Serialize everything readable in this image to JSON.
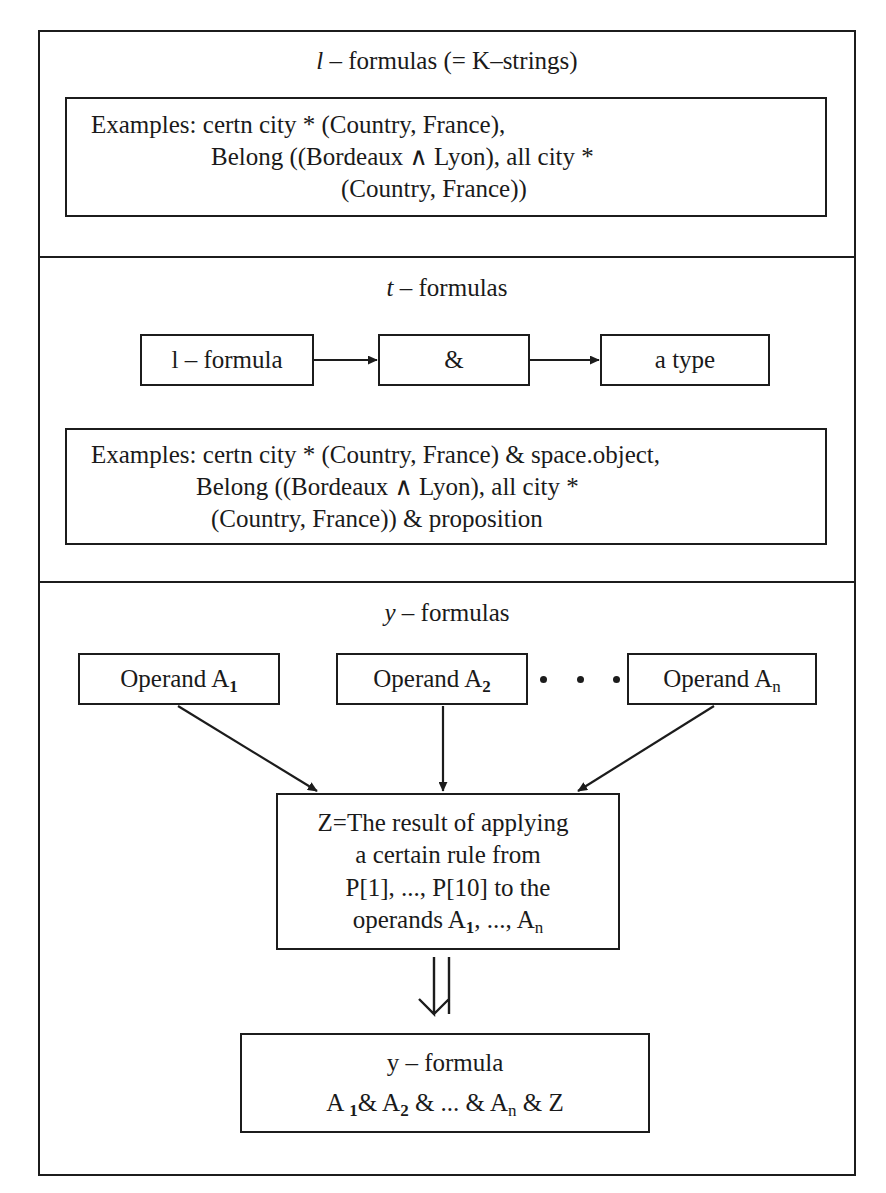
{
  "figure": {
    "sections": [
      {
        "id": "l-formulas",
        "title_prefix": "l",
        "title_rest": " – formulas (= K–strings)",
        "examples": {
          "line1": "Examples: certn city * (Country, France),",
          "line2": "Belong ((Bordeaux ∧ Lyon), all city *",
          "line3": "(Country, France))"
        }
      },
      {
        "id": "t-formulas",
        "title_prefix": "t",
        "title_rest": " – formulas",
        "chain": {
          "node1_prefix": "l",
          "node1_rest": " – formula",
          "node2": "&",
          "node3": "a type"
        },
        "examples": {
          "line1": "Examples: certn city * (Country, France) & space.object,",
          "line2": "Belong ((Bordeaux ∧ Lyon), all city *",
          "line3": "(Country, France)) & proposition"
        }
      },
      {
        "id": "y-formulas",
        "title_prefix": "y",
        "title_rest": " – formulas",
        "operands": [
          {
            "label": "Operand A",
            "subscript": "1",
            "subscript_bold": true
          },
          {
            "label": "Operand A",
            "subscript": "2",
            "subscript_bold": true
          },
          {
            "label": "Operand A",
            "subscript": "n",
            "subscript_bold": false
          }
        ],
        "ellipsis_dot_count": 3,
        "result_box": {
          "line1": "Z=The result of applying",
          "line2": "a certain rule from",
          "line3": "P[1], ..., P[10] to the",
          "line4_prefix": "operands A",
          "line4_sub1": "1",
          "line4_mid": ", ..., A",
          "line4_sub2": "n"
        },
        "final_box": {
          "title_prefix": "y",
          "title_rest": " – formula",
          "formula_a": "A ",
          "formula_sub1": "1",
          "formula_amp1": "& A",
          "formula_sub2": "2",
          "formula_mid": " & ... & A",
          "formula_sub3": "n",
          "formula_tail": " & Z"
        }
      }
    ],
    "colors": {
      "stroke": "#1c1c1c",
      "background": "#ffffff",
      "text": "#1a1a1a"
    }
  }
}
